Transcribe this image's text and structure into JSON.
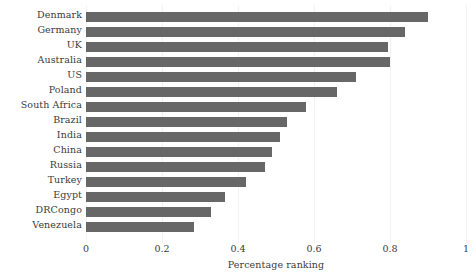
{
  "chart_data": {
    "type": "bar",
    "orientation": "horizontal",
    "title": "",
    "xlabel": "Percentage ranking",
    "ylabel": "",
    "xlim": [
      0,
      1
    ],
    "xticks": [
      "0",
      "0.2",
      "0.4",
      "0.6",
      "0.8",
      "1"
    ],
    "xtick_values": [
      0,
      0.2,
      0.4,
      0.6,
      0.8,
      1
    ],
    "grid": "vertical-faint",
    "legend": "none",
    "bar_color": "#676767",
    "categories": [
      "Denmark",
      "Germany",
      "UK",
      "Australia",
      "US",
      "Poland",
      "South Africa",
      "Brazil",
      "India",
      "China",
      "Russia",
      "Turkey",
      "Egypt",
      "DRCongo",
      "Venezuela"
    ],
    "values": [
      0.9,
      0.84,
      0.795,
      0.8,
      0.71,
      0.66,
      0.58,
      0.53,
      0.51,
      0.49,
      0.47,
      0.42,
      0.365,
      0.33,
      0.285
    ]
  },
  "axis": {
    "x_title": "Percentage ranking",
    "y_title_clipped": "Country"
  }
}
